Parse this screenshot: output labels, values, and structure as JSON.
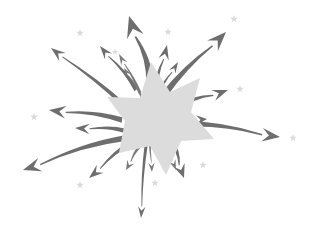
{
  "artwork": {
    "title": "Starburst with radiating arrows",
    "width": 315,
    "height": 232,
    "background_color": "#ffffff",
    "arrow_color": "#6e6e6e",
    "arrow_color_light": "#8a8a8a",
    "center_star_fill": "#dcdcdc",
    "sparkle_fill": "#d9d9d9",
    "center": {
      "x": 152,
      "y": 111
    }
  },
  "center_star": {
    "name": "center-star",
    "fill": "#dcdcdc",
    "points": "151,62 170,92 200,78 191,112 214,139 181,141 166,175 150,146 119,153 125,121 107,97 140,98"
  },
  "arrows": [
    {
      "id": "arrow-up",
      "label": "up",
      "tip": {
        "x": 129,
        "y": 16
      },
      "tail": {
        "x": 150,
        "y": 84
      },
      "width": 7.5,
      "bow": 7,
      "color": "#6e6e6e"
    },
    {
      "id": "arrow-up-slight-left",
      "label": "up slight left",
      "tip": {
        "x": 100,
        "y": 46
      },
      "tail": {
        "x": 136,
        "y": 90
      },
      "width": 4.0,
      "bow": 4,
      "color": "#6e6e6e"
    },
    {
      "id": "arrow-up-short",
      "label": "up short",
      "tip": {
        "x": 119,
        "y": 54
      },
      "tail": {
        "x": 140,
        "y": 93
      },
      "width": 3.0,
      "bow": 2,
      "color": "#7a7a7a"
    },
    {
      "id": "arrow-up-inner",
      "label": "up inner",
      "tip": {
        "x": 124,
        "y": 68
      },
      "tail": {
        "x": 142,
        "y": 98
      },
      "width": 2.2,
      "bow": 2,
      "color": "#7a7a7a"
    },
    {
      "id": "arrow-up-right-1",
      "label": "up right steep",
      "tip": {
        "x": 167,
        "y": 45
      },
      "tail": {
        "x": 156,
        "y": 92
      },
      "width": 4.5,
      "bow": -4,
      "color": "#6e6e6e"
    },
    {
      "id": "arrow-up-right-2",
      "label": "up right mid",
      "tip": {
        "x": 178,
        "y": 62
      },
      "tail": {
        "x": 158,
        "y": 96
      },
      "width": 3.2,
      "bow": -3,
      "color": "#6e6e6e"
    },
    {
      "id": "arrow-up-right-3",
      "label": "up right long",
      "tip": {
        "x": 226,
        "y": 32
      },
      "tail": {
        "x": 164,
        "y": 95
      },
      "width": 6.5,
      "bow": -5,
      "color": "#6e6e6e"
    },
    {
      "id": "arrow-right-upper",
      "label": "right upper",
      "tip": {
        "x": 228,
        "y": 90
      },
      "tail": {
        "x": 176,
        "y": 109
      },
      "width": 5.0,
      "bow": -6,
      "color": "#6e6e6e"
    },
    {
      "id": "arrow-right-mid",
      "label": "right middle",
      "tip": {
        "x": 207,
        "y": 119
      },
      "tail": {
        "x": 176,
        "y": 122
      },
      "width": 4.2,
      "bow": -4,
      "color": "#6e6e6e"
    },
    {
      "id": "arrow-right-long",
      "label": "right long",
      "tip": {
        "x": 280,
        "y": 137
      },
      "tail": {
        "x": 178,
        "y": 124
      },
      "width": 6.0,
      "bow": -7,
      "color": "#6e6e6e"
    },
    {
      "id": "arrow-down-right-1",
      "label": "down right",
      "tip": {
        "x": 184,
        "y": 178
      },
      "tail": {
        "x": 170,
        "y": 140
      },
      "width": 5.0,
      "bow": -5,
      "color": "#6e6e6e"
    },
    {
      "id": "arrow-down-right-2",
      "label": "down right short",
      "tip": {
        "x": 176,
        "y": 170
      },
      "tail": {
        "x": 165,
        "y": 142
      },
      "width": 3.0,
      "bow": -2,
      "color": "#7a7a7a"
    },
    {
      "id": "arrow-down-inner",
      "label": "down inner",
      "tip": {
        "x": 152,
        "y": 172
      },
      "tail": {
        "x": 150,
        "y": 140
      },
      "width": 2.2,
      "bow": 1,
      "color": "#7a7a7a"
    },
    {
      "id": "arrow-down-long",
      "label": "down long",
      "tip": {
        "x": 141,
        "y": 218
      },
      "tail": {
        "x": 146,
        "y": 146
      },
      "width": 3.2,
      "bow": 2,
      "color": "#6e6e6e"
    },
    {
      "id": "arrow-down-left-1",
      "label": "down left",
      "tip": {
        "x": 126,
        "y": 170
      },
      "tail": {
        "x": 140,
        "y": 146
      },
      "width": 3.4,
      "bow": 2,
      "color": "#7a7a7a"
    },
    {
      "id": "arrow-down-left-2",
      "label": "down left mid",
      "tip": {
        "x": 89,
        "y": 178
      },
      "tail": {
        "x": 132,
        "y": 142
      },
      "width": 4.5,
      "bow": 4,
      "color": "#6e6e6e"
    },
    {
      "id": "arrow-down-left-3",
      "label": "down left long",
      "tip": {
        "x": 23,
        "y": 170
      },
      "tail": {
        "x": 126,
        "y": 138
      },
      "width": 6.0,
      "bow": 7,
      "color": "#6e6e6e"
    },
    {
      "id": "arrow-left-lower",
      "label": "left lower",
      "tip": {
        "x": 75,
        "y": 128
      },
      "tail": {
        "x": 126,
        "y": 131
      },
      "width": 4.5,
      "bow": 4,
      "color": "#6e6e6e"
    },
    {
      "id": "arrow-left-upper",
      "label": "left upper",
      "tip": {
        "x": 49,
        "y": 110
      },
      "tail": {
        "x": 122,
        "y": 120
      },
      "width": 5.5,
      "bow": 5,
      "color": "#6e6e6e"
    },
    {
      "id": "arrow-up-left-long",
      "label": "up left long",
      "tip": {
        "x": 51,
        "y": 48
      },
      "tail": {
        "x": 124,
        "y": 105
      },
      "width": 4.5,
      "bow": 3,
      "color": "#6e6e6e"
    }
  ],
  "sparkles": [
    {
      "id": "sparkle-top-left",
      "x": 80,
      "y": 33,
      "size": 8
    },
    {
      "id": "sparkle-top-mid",
      "x": 115,
      "y": 52,
      "size": 7
    },
    {
      "id": "sparkle-top-center",
      "x": 168,
      "y": 32,
      "size": 8
    },
    {
      "id": "sparkle-top-right",
      "x": 234,
      "y": 19,
      "size": 8
    },
    {
      "id": "sparkle-right-upper",
      "x": 240,
      "y": 89,
      "size": 8
    },
    {
      "id": "sparkle-right-edge",
      "x": 293,
      "y": 138,
      "size": 8
    },
    {
      "id": "sparkle-left-mid",
      "x": 34,
      "y": 117,
      "size": 8
    },
    {
      "id": "sparkle-bottom-right",
      "x": 203,
      "y": 165,
      "size": 8
    },
    {
      "id": "sparkle-bottom-center",
      "x": 155,
      "y": 183,
      "size": 8
    },
    {
      "id": "sparkle-bottom-left",
      "x": 80,
      "y": 185,
      "size": 8
    }
  ]
}
